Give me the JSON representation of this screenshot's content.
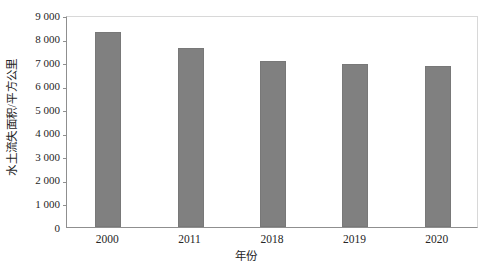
{
  "chart_data": {
    "type": "bar",
    "title": "",
    "subtitle": "",
    "xlabel": "年份",
    "ylabel": "水土流失面积/平方公里",
    "categories": [
      "2000",
      "2011",
      "2018",
      "2019",
      "2020"
    ],
    "values": [
      8300,
      7620,
      7050,
      6900,
      6850
    ],
    "series": [
      {
        "name": "水土流失面积",
        "values": [
          8300,
          7620,
          7050,
          6900,
          6850
        ]
      }
    ],
    "ylim": [
      0,
      9000
    ],
    "ytick_values": [
      0,
      1000,
      2000,
      3000,
      4000,
      5000,
      6000,
      7000,
      8000,
      9000
    ],
    "ytick_labels": [
      "0",
      "1 000",
      "2 000",
      "3 000",
      "4 000",
      "5 000",
      "6 000",
      "7 000",
      "8 000",
      "9 000"
    ],
    "grid": false,
    "legend": "none",
    "bar_color": "#808080",
    "axis_color": "#8f8f8f",
    "text_color": "#262626"
  }
}
